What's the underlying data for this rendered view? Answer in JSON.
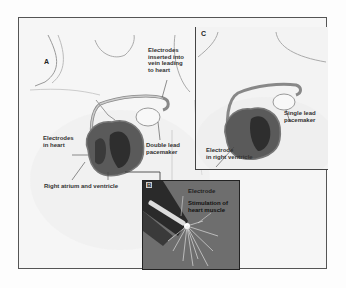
{
  "figure": {
    "panels": [
      {
        "id": "A",
        "letter": "A"
      },
      {
        "id": "B",
        "letter": "B"
      },
      {
        "id": "C",
        "letter": "C"
      }
    ],
    "labels": {
      "a_electrodes_vein": "Electrodes\ninserted into\nvein leading\nto heart",
      "a_electrodes_heart": "Electrodes\nin heart",
      "a_double_lead": "Double lead\npacemaker",
      "a_right_atrium": "Right atrium and ventricle",
      "b_electrode": "Electrode",
      "b_stimulation": "Stimulation of\nheart muscle",
      "c_single_lead": "Single lead\npacemaker",
      "c_electrode_rv": "Electrode\nin right ventricle"
    }
  }
}
